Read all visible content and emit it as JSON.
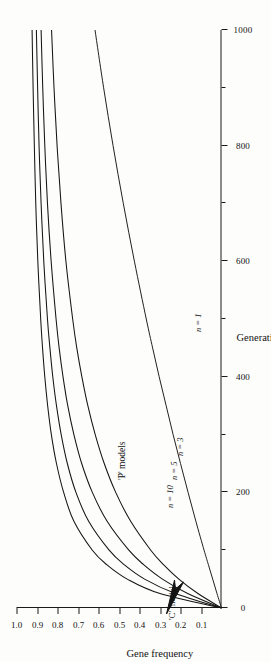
{
  "chart_data": {
    "type": "line",
    "title": "",
    "xlabel": "Generations",
    "ylabel": "Gene frequency",
    "xlim": [
      0,
      1000
    ],
    "ylim": [
      0,
      1.0
    ],
    "grid": false,
    "legend": "inline-annotations",
    "orientation": "page-rotated-90-ccw",
    "x_ticks": [
      {
        "value": 0,
        "label": "0",
        "major": true
      },
      {
        "value": 100,
        "label": "",
        "major": false
      },
      {
        "value": 200,
        "label": "200",
        "major": true
      },
      {
        "value": 300,
        "label": "",
        "major": false
      },
      {
        "value": 400,
        "label": "400",
        "major": true
      },
      {
        "value": 500,
        "label": "",
        "major": false
      },
      {
        "value": 600,
        "label": "600",
        "major": true
      },
      {
        "value": 700,
        "label": "",
        "major": false
      },
      {
        "value": 800,
        "label": "800",
        "major": true
      },
      {
        "value": 900,
        "label": "",
        "major": false
      },
      {
        "value": 1000,
        "label": "1000",
        "major": true
      }
    ],
    "y_ticks": [
      {
        "value": 0.1,
        "label": "0.1"
      },
      {
        "value": 0.2,
        "label": "0.2"
      },
      {
        "value": 0.3,
        "label": "0.3"
      },
      {
        "value": 0.4,
        "label": "0.4"
      },
      {
        "value": 0.5,
        "label": "0.5"
      },
      {
        "value": 0.6,
        "label": "0.6"
      },
      {
        "value": 0.7,
        "label": "0.7"
      },
      {
        "value": 0.8,
        "label": "0.8"
      },
      {
        "value": 0.9,
        "label": "0.9"
      },
      {
        "value": 1.0,
        "label": "1.0"
      }
    ],
    "x": [
      0,
      25,
      50,
      75,
      100,
      150,
      200,
      250,
      300,
      350,
      400,
      450,
      500,
      600,
      700,
      800,
      900,
      1000
    ],
    "series": [
      {
        "name": "'C' model",
        "label": "'C' model",
        "color": "#151515",
        "values": [
          0.0,
          0.3,
          0.46,
          0.56,
          0.63,
          0.72,
          0.77,
          0.805,
          0.83,
          0.848,
          0.862,
          0.873,
          0.882,
          0.896,
          0.906,
          0.913,
          0.919,
          0.924
        ]
      },
      {
        "name": "n = 10",
        "label": "n = 10",
        "color": "#151515",
        "values": [
          0.0,
          0.225,
          0.375,
          0.475,
          0.548,
          0.648,
          0.71,
          0.752,
          0.782,
          0.805,
          0.823,
          0.837,
          0.849,
          0.867,
          0.88,
          0.89,
          0.897,
          0.903
        ]
      },
      {
        "name": "n = 5",
        "label": "n = 5",
        "color": "#151515",
        "values": [
          0.0,
          0.165,
          0.288,
          0.38,
          0.452,
          0.558,
          0.63,
          0.682,
          0.72,
          0.75,
          0.773,
          0.792,
          0.807,
          0.831,
          0.849,
          0.862,
          0.872,
          0.88
        ]
      },
      {
        "name": "n = 3",
        "label": "n = 3",
        "color": "#151515",
        "values": [
          0.0,
          0.115,
          0.208,
          0.283,
          0.345,
          0.443,
          0.516,
          0.572,
          0.616,
          0.652,
          0.681,
          0.706,
          0.726,
          0.759,
          0.783,
          0.802,
          0.817,
          0.829
        ]
      },
      {
        "name": "n = 1",
        "label": "n = 1",
        "color": "#151515",
        "values": [
          0.0,
          0.022,
          0.043,
          0.064,
          0.085,
          0.125,
          0.163,
          0.2,
          0.236,
          0.27,
          0.304,
          0.336,
          0.367,
          0.425,
          0.479,
          0.529,
          0.575,
          0.617
        ]
      }
    ],
    "annotations": [
      {
        "id": "c-model",
        "text": "'C' model",
        "has_arrow": true
      },
      {
        "id": "p-models",
        "text": "'P' models",
        "has_arrow": false
      },
      {
        "id": "n10",
        "text": "n = 10",
        "has_arrow": false
      },
      {
        "id": "n5",
        "text": "n = 5",
        "has_arrow": false
      },
      {
        "id": "n3",
        "text": "n = 3",
        "has_arrow": false
      },
      {
        "id": "n1",
        "text": "n = 1",
        "has_arrow": false
      }
    ]
  }
}
